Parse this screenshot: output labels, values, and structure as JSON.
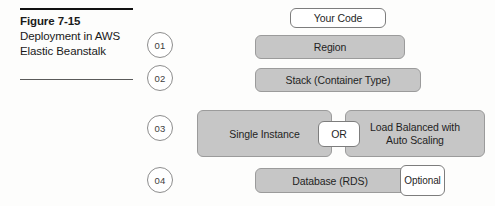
{
  "figure": {
    "caption": {
      "title": "Figure 7-15",
      "description": "Deployment in AWS Elastic Beanstalk"
    },
    "steps": [
      {
        "id": "01",
        "label": "01"
      },
      {
        "id": "02",
        "label": "02"
      },
      {
        "id": "03",
        "label": "03"
      },
      {
        "id": "04",
        "label": "04"
      }
    ],
    "boxes": {
      "your_code": "Your Code",
      "region": "Region",
      "stack": "Stack (Container Type)",
      "single_instance": "Single Instance",
      "or": "OR",
      "load_balanced_line1": "Load Balanced with",
      "load_balanced_line2": "Auto Scaling",
      "database": "Database (RDS)",
      "optional": "Optional"
    },
    "colors": {
      "box_fill_gray": "#c6c6c6",
      "box_fill_white": "#ffffff",
      "box_border": "#9b9b9b",
      "circle_border": "#8d8d8d",
      "text": "#1f1f1f",
      "rule": "#111111",
      "background": "#fdfdfc"
    }
  }
}
